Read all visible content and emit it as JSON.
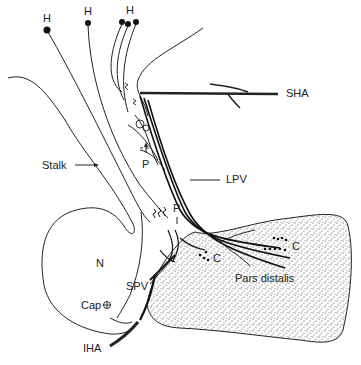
{
  "diagram": {
    "type": "anatomical",
    "labels": {
      "h1": "H",
      "h2": "H",
      "h3": "H",
      "stalk": "Stalk",
      "p_upper": "P",
      "p_lower": "P",
      "sha": "SHA",
      "lpv": "LPV",
      "n": "N",
      "c_left": "C",
      "c_right": "C",
      "pars_distalis": "Pars distalis",
      "spv": "SPV",
      "cap": "Cap",
      "iha": "IHA"
    },
    "colors": {
      "ink": "#222222",
      "background": "#ffffff"
    }
  }
}
